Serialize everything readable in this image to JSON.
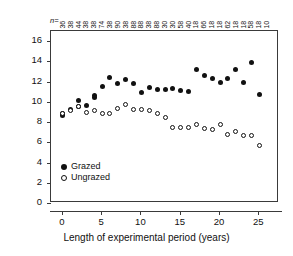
{
  "figure": {
    "sample_size_prefix": "n=",
    "significance": {
      "text_p": "P",
      "text_rest": " < 0.05",
      "full": "P < 0.05",
      "start_year": 3
    }
  },
  "axes": {
    "y": {
      "title_main": "Species richness (2 x 2m",
      "title_sup": "2",
      "title_tail": ")",
      "ticks": [
        0,
        2,
        4,
        6,
        8,
        10,
        12,
        14,
        16
      ],
      "ticklabels": [
        "0",
        "2",
        "4",
        "6",
        "8",
        "10",
        "12",
        "14",
        "16"
      ],
      "min": 0,
      "max": 17
    },
    "x": {
      "title": "Length of experimental period (years)",
      "ticks": [
        0,
        5,
        10,
        15,
        20,
        25
      ],
      "ticklabels": [
        "0",
        "5",
        "10",
        "15",
        "20",
        "25"
      ],
      "min": -1.5,
      "max": 27.5
    }
  },
  "legend": {
    "position": "bottom-left-inside",
    "entries": [
      {
        "marker": "filled-circle",
        "label": "Grazed"
      },
      {
        "marker": "open-circle",
        "label": "Ungrazed"
      }
    ]
  },
  "chart_data": {
    "type": "scatter",
    "title": "",
    "xlabel": "Length of experimental period (years)",
    "ylabel": "Species richness (2 x 2m2)",
    "xlim": [
      -1.5,
      27.5
    ],
    "ylim": [
      0,
      17
    ],
    "grid": false,
    "legend_position": "lower-left inside axes",
    "annotations": [
      {
        "text": "P < 0.05",
        "x": 3,
        "type": "vertical-line-with-right-arrow",
        "y_top": 16.3
      }
    ],
    "secondary_axis_top": {
      "label": "n=",
      "values": [
        36,
        38,
        44,
        38,
        38,
        74,
        38,
        90,
        38,
        88,
        88,
        38,
        88,
        30,
        30,
        58,
        40,
        18,
        66,
        18,
        18,
        62,
        18,
        18,
        58,
        18,
        10
      ]
    },
    "x": [
      0,
      1,
      2,
      3,
      4,
      5,
      6,
      7,
      8,
      9,
      10,
      11,
      12,
      13,
      14,
      15,
      16,
      17,
      18,
      19,
      20,
      21,
      22,
      23,
      24,
      25
    ],
    "series": [
      {
        "name": "Grazed",
        "marker": "filled-circle",
        "color": "#111111",
        "x": [
          0,
          0,
          1,
          2,
          2,
          3,
          4,
          4,
          5,
          6,
          7,
          8,
          9,
          10,
          11,
          12,
          13,
          14,
          15,
          16,
          17,
          18,
          19,
          20,
          21,
          22,
          23,
          24,
          25
        ],
        "values": [
          8.8,
          8.6,
          9.2,
          10.1,
          9.5,
          9.6,
          10.6,
          10.45,
          11.55,
          12.4,
          11.8,
          12.25,
          11.85,
          10.9,
          11.45,
          11.25,
          11.25,
          11.3,
          11.15,
          11.05,
          13.15,
          12.6,
          12.35,
          11.9,
          12.35,
          13.2,
          11.95,
          13.85,
          10.75
        ]
      },
      {
        "name": "Ungrazed",
        "marker": "open-circle",
        "color": "#ffffff",
        "x": [
          0,
          1,
          2,
          3,
          4,
          5,
          6,
          7,
          8,
          9,
          10,
          11,
          12,
          13,
          14,
          15,
          16,
          17,
          18,
          19,
          20,
          21,
          22,
          23,
          24,
          25
        ],
        "values": [
          8.8,
          9.15,
          9.55,
          8.95,
          9.1,
          8.8,
          8.85,
          9.3,
          9.7,
          9.25,
          9.2,
          9.1,
          8.8,
          8.45,
          7.5,
          7.45,
          7.45,
          7.8,
          7.35,
          7.25,
          7.8,
          6.75,
          7.05,
          6.65,
          6.65,
          5.65
        ]
      }
    ]
  }
}
